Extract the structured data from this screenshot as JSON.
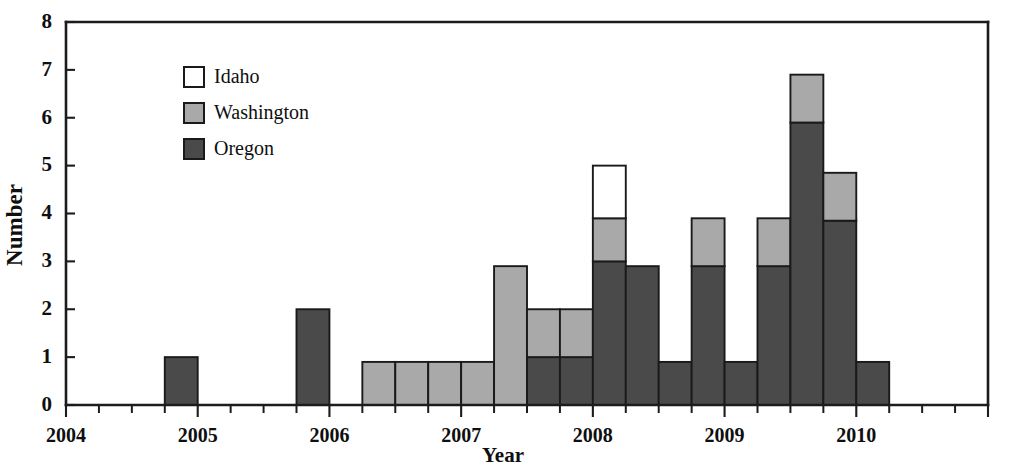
{
  "chart_data": {
    "type": "bar",
    "title": "",
    "subtitle": "",
    "xlabel": "Year",
    "ylabel": "Number",
    "ylim": [
      0,
      8
    ],
    "yticks": [
      0,
      1,
      2,
      3,
      4,
      5,
      6,
      7,
      8
    ],
    "ytick_labels": [
      "0",
      "1",
      "2",
      "3",
      "4",
      "5",
      "6",
      "7",
      "8"
    ],
    "xlim": [
      2004.0,
      2011.0
    ],
    "xticks": [
      2004,
      2005,
      2006,
      2007,
      2008,
      2009,
      2010
    ],
    "xtick_labels": [
      "2004",
      "2005",
      "2006",
      "2007",
      "2008",
      "2009",
      "2010"
    ],
    "minor_xticks_per_year": 4,
    "grid": false,
    "stacked": true,
    "bar_width_years": 0.25,
    "legend_position": "upper-left-inside",
    "legend_entries": [
      "Idaho",
      "Washington",
      "Oregon"
    ],
    "series": [
      {
        "name": "Oregon",
        "color": "#4a4a4a",
        "values": [
          0,
          0,
          0,
          1,
          0,
          0,
          0,
          2,
          0,
          0,
          0,
          0,
          0,
          0,
          1,
          1,
          3,
          2.9,
          0.9,
          2.9,
          0.9,
          2.9,
          5.9,
          3.85,
          0.9
        ]
      },
      {
        "name": "Washington",
        "color": "#a9a9a9",
        "values": [
          0,
          0,
          0,
          0,
          0,
          0,
          0,
          0,
          0,
          0.9,
          0.9,
          0.9,
          0.9,
          2.9,
          1,
          1,
          0.9,
          0,
          0,
          1,
          0,
          1,
          1,
          1,
          0
        ]
      },
      {
        "name": "Idaho",
        "color": "#ffffff",
        "values": [
          0,
          0,
          0,
          0,
          0,
          0,
          0,
          0,
          0,
          0,
          0,
          0,
          0,
          0,
          0,
          0,
          1.1,
          0,
          0,
          0,
          0,
          0,
          0,
          0,
          0
        ]
      }
    ],
    "x": [
      2004.0,
      2004.25,
      2004.5,
      2004.75,
      2005.0,
      2005.25,
      2005.5,
      2005.75,
      2006.0,
      2006.25,
      2006.5,
      2006.75,
      2007.0,
      2007.25,
      2007.5,
      2007.75,
      2008.0,
      2008.25,
      2008.5,
      2008.75,
      2009.0,
      2009.25,
      2009.5,
      2009.75,
      2010.0
    ],
    "x_labels": [
      "2004 Q1",
      "2004 Q2",
      "2004 Q3",
      "2004 Q4",
      "2005 Q1",
      "2005 Q2",
      "2005 Q3",
      "2005 Q4",
      "2006 Q1",
      "2006 Q2",
      "2006 Q3",
      "2006 Q4",
      "2007 Q1",
      "2007 Q2",
      "2007 Q3",
      "2007 Q4",
      "2008 Q1",
      "2008 Q2",
      "2008 Q3",
      "2008 Q4",
      "2009 Q1",
      "2009 Q2",
      "2009 Q3",
      "2009 Q4",
      "2010 Q1"
    ],
    "totals": [
      0,
      0,
      0,
      1,
      0,
      0,
      0,
      2,
      0,
      0.9,
      0.9,
      0.9,
      0.9,
      2.9,
      2,
      2,
      5,
      2.9,
      0.9,
      3.9,
      0.9,
      3.9,
      6.9,
      4.85,
      0.9
    ]
  },
  "colors": {
    "idaho": "#ffffff",
    "washington": "#a9a9a9",
    "oregon": "#4a4a4a",
    "outline": "#1a1a1a",
    "axis": "#1c1c1c",
    "background": "#ffffff"
  }
}
